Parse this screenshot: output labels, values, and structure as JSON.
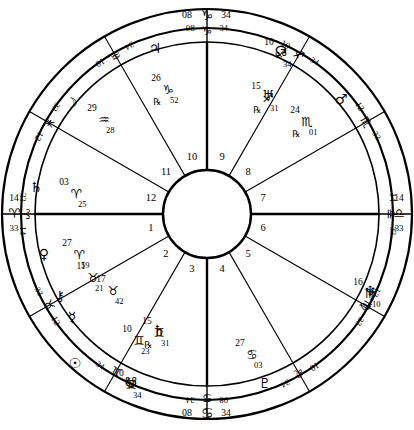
{
  "chart_data": {
    "type": "wheel",
    "subtitle": "",
    "geometry": {
      "cx": 207,
      "cy": 214,
      "r_outer": 205,
      "r_zodiac_inner": 186,
      "r_cusp_ring": 172,
      "r_inner_hub": 44,
      "r_house_num": 58
    },
    "ascendant_sign": "Aries",
    "angles": [
      {
        "name": "Ascendant",
        "label_deg": "14",
        "glyph": "♈",
        "label_min": "33",
        "position": "left"
      },
      {
        "name": "Descendant",
        "label_deg": "14",
        "glyph": "♎",
        "label_min": "33",
        "position": "right"
      },
      {
        "name": "Midheaven",
        "label_deg": "08",
        "glyph": "♑",
        "label_min": "34",
        "position": "top"
      },
      {
        "name": "Imum Coeli",
        "label_deg": "08",
        "glyph": "♋",
        "label_min": "34",
        "position": "bottom"
      }
    ],
    "house_numbers": [
      "1",
      "2",
      "3",
      "4",
      "5",
      "6",
      "7",
      "8",
      "9",
      "10",
      "11",
      "12"
    ],
    "cusps": [
      {
        "house": 1,
        "deg": "14",
        "glyph": "♈",
        "min": "33",
        "angle_deg": 180
      },
      {
        "house": 2,
        "deg": "12",
        "glyph": "♉",
        "min": "33",
        "angle_deg": 210
      },
      {
        "house": 3,
        "deg": "10",
        "glyph": "♊",
        "min": "34",
        "angle_deg": 240
      },
      {
        "house": 4,
        "deg": "08",
        "glyph": "♋",
        "min": "34",
        "angle_deg": 270
      },
      {
        "house": 5,
        "deg": "10",
        "glyph": "♌",
        "min": "34",
        "angle_deg": 300
      },
      {
        "house": 6,
        "deg": "12",
        "glyph": "♍",
        "min": "33",
        "angle_deg": 330
      },
      {
        "house": 7,
        "deg": "14",
        "glyph": "♎",
        "min": "33",
        "angle_deg": 0
      },
      {
        "house": 8,
        "deg": "12",
        "glyph": "♏",
        "min": "33",
        "angle_deg": 30
      },
      {
        "house": 9,
        "deg": "10",
        "glyph": "♐",
        "min": "34",
        "angle_deg": 60
      },
      {
        "house": 10,
        "deg": "08",
        "glyph": "♑",
        "min": "34",
        "angle_deg": 90
      },
      {
        "house": 11,
        "deg": "10",
        "glyph": "♒",
        "min": "34",
        "angle_deg": 120
      },
      {
        "house": 12,
        "deg": "12",
        "glyph": "♓",
        "min": "33",
        "angle_deg": 150
      }
    ],
    "planets": [
      {
        "name": "Moon",
        "glyph": "☽",
        "deg": "29",
        "sign": "♒",
        "min": "28",
        "retro": "",
        "x": 104,
        "y": 118,
        "gx": 71,
        "gy": 104
      },
      {
        "name": "Jupiter",
        "glyph": "♃",
        "deg": "26",
        "sign": "♑",
        "min": "52",
        "retro": "℞",
        "x": 168,
        "y": 88,
        "gx": 155,
        "gy": 49
      },
      {
        "name": "NorthNode",
        "glyph": "☊",
        "deg": "10",
        "sign": "♐",
        "min": "34",
        "retro": "",
        "x": 281,
        "y": 52,
        "gx": 281,
        "gy": 52
      },
      {
        "name": "Uranus",
        "glyph": "♅",
        "deg": "15",
        "sign": "♐",
        "min": "31",
        "retro": "℞",
        "x": 268,
        "y": 96,
        "gx": 268,
        "gy": 96
      },
      {
        "name": "Mars",
        "glyph": "♂",
        "deg": "24",
        "sign": "♏",
        "min": "01",
        "retro": "℞",
        "x": 307,
        "y": 120,
        "gx": 341,
        "gy": 100
      },
      {
        "name": "Neptune",
        "glyph": "♆",
        "deg": "16",
        "sign": "♍",
        "min": "10",
        "retro": "",
        "x": 370,
        "y": 292,
        "gx": 370,
        "gy": 292
      },
      {
        "name": "Pluto",
        "glyph": "♇",
        "deg": "27",
        "sign": "♋",
        "min": "03",
        "retro": "",
        "x": 252,
        "y": 353,
        "gx": 265,
        "gy": 384
      },
      {
        "name": "SouthNode",
        "glyph": "☋",
        "deg": "10",
        "sign": "♊",
        "min": "34",
        "retro": "",
        "x": 131,
        "y": 383,
        "gx": 131,
        "gy": 383
      },
      {
        "name": "Sun",
        "glyph": "☉",
        "deg": "10",
        "sign": "♊",
        "min": "23",
        "retro": "",
        "x": 139,
        "y": 339,
        "gx": 75,
        "gy": 364
      },
      {
        "name": "Saturn2",
        "glyph": "♄",
        "deg": "15",
        "sign": "♊",
        "min": "31",
        "retro": "℞",
        "x": 159,
        "y": 331,
        "gx": 159,
        "gy": 331
      },
      {
        "name": "Mercury",
        "glyph": "☿",
        "deg": "17",
        "sign": "♉",
        "min": "42",
        "retro": "",
        "x": 113,
        "y": 289,
        "gx": 72,
        "gy": 318
      },
      {
        "name": "Chiron",
        "glyph": "⚷",
        "deg": "11",
        "sign": "♉",
        "min": "21",
        "retro": "",
        "x": 93,
        "y": 276,
        "gx": 60,
        "gy": 297
      },
      {
        "name": "Venus",
        "glyph": "♀",
        "deg": "27",
        "sign": "♈",
        "min": "59",
        "retro": "",
        "x": 79,
        "y": 253,
        "gx": 44,
        "gy": 255
      },
      {
        "name": "Saturn",
        "glyph": "♄",
        "deg": "03",
        "sign": "♈",
        "min": "25",
        "retro": "",
        "x": 76,
        "y": 192,
        "gx": 36,
        "gy": 188
      }
    ],
    "colors": {
      "stroke": "#000000",
      "background": "#ffffff",
      "text": "#000000"
    }
  }
}
